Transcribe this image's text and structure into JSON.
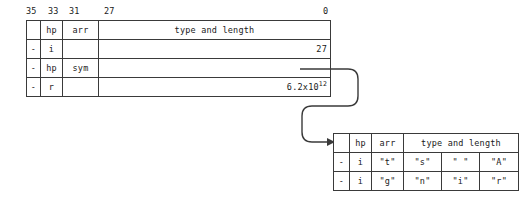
{
  "diagram": {
    "line_color": "#3a3a3a",
    "text_color": "#1a1a1a",
    "background": "#ffffff"
  },
  "bit_ruler": {
    "name": "bit-position-ruler",
    "ticks": [
      {
        "label": "35",
        "x": 0
      },
      {
        "label": "33",
        "x": 22
      },
      {
        "label": "31",
        "x": 43
      },
      {
        "label": "27",
        "x": 78
      },
      {
        "label": "0",
        "x": 297
      }
    ]
  },
  "top_table": {
    "name": "primary-word-table",
    "rows": [
      {
        "name": "header-row",
        "cells": [
          {
            "text": "",
            "align": "center"
          },
          {
            "text": "hp",
            "align": "center"
          },
          {
            "text": "arr",
            "align": "center"
          },
          {
            "text": "type and length",
            "align": "center"
          }
        ]
      },
      {
        "name": "integer-row",
        "cells": [
          {
            "text": "-",
            "align": "center"
          },
          {
            "text": "i",
            "align": "center"
          },
          {
            "text": "",
            "align": "center"
          },
          {
            "text": "27",
            "align": "right"
          }
        ]
      },
      {
        "name": "symbol-row",
        "cells": [
          {
            "text": "-",
            "align": "center"
          },
          {
            "text": "hp",
            "align": "center"
          },
          {
            "text": "sym",
            "align": "center"
          },
          {
            "text": "",
            "align": "left"
          }
        ]
      },
      {
        "name": "real-row",
        "cells": [
          {
            "text": "-",
            "align": "center"
          },
          {
            "text": "r",
            "align": "center"
          },
          {
            "text": "",
            "align": "center"
          },
          {
            "text": "",
            "align": "right",
            "html": "6.2x10<sup>12</sup>",
            "plain": "6.2x10^12"
          }
        ]
      }
    ]
  },
  "bottom_table": {
    "name": "string-word-table",
    "rows": [
      {
        "name": "header-row",
        "cells": [
          {
            "text": "",
            "align": "center"
          },
          {
            "text": "hp",
            "align": "center"
          },
          {
            "text": "arr",
            "align": "center"
          },
          {
            "text": "type and length",
            "align": "center"
          }
        ]
      },
      {
        "name": "string-row-1",
        "cells": [
          {
            "text": "-",
            "align": "center"
          },
          {
            "text": "i",
            "align": "center"
          },
          {
            "text": "\"t\"",
            "align": "center"
          },
          {
            "text": "\"s\"",
            "align": "center"
          },
          {
            "text": "\" \"",
            "align": "center"
          },
          {
            "text": "\"A\"",
            "align": "center"
          }
        ]
      },
      {
        "name": "string-row-2",
        "cells": [
          {
            "text": "-",
            "align": "center"
          },
          {
            "text": "i",
            "align": "center"
          },
          {
            "text": "\"g\"",
            "align": "center"
          },
          {
            "text": "\"n\"",
            "align": "center"
          },
          {
            "text": "\"i\"",
            "align": "center"
          },
          {
            "text": "\"r\"",
            "align": "center"
          }
        ]
      }
    ]
  },
  "connector": {
    "name": "pointer-arrow",
    "from": "symbol-row",
    "to": "string-word-table",
    "arrowhead": "right-triangle"
  }
}
